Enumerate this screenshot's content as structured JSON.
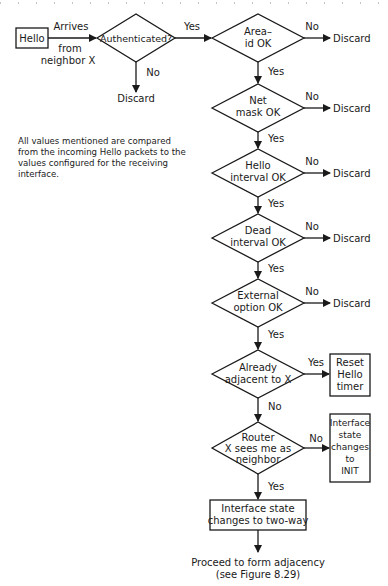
{
  "diagram": {
    "start": {
      "label": "Hello",
      "arrow_top": "Arrives",
      "arrow_bottom_1": "from",
      "arrow_bottom_2": "neighbor X"
    },
    "authenticated": {
      "label": "Authenticated?",
      "yes": "Yes",
      "no": "No",
      "no_target": "Discard"
    },
    "checks": [
      {
        "line1": "Area–",
        "line2": "id OK",
        "no": "No",
        "no_target": "Discard",
        "yes": "Yes"
      },
      {
        "line1": "Net",
        "line2": "mask OK",
        "no": "No",
        "no_target": "Discard",
        "yes": "Yes"
      },
      {
        "line1": "Hello",
        "line2": "interval OK",
        "no": "No",
        "no_target": "Discard",
        "yes": "Yes"
      },
      {
        "line1": "Dead",
        "line2": "interval OK",
        "no": "No",
        "no_target": "Discard",
        "yes": "Yes"
      },
      {
        "line1": "External",
        "line2": "option OK",
        "no": "No",
        "no_target": "Discard",
        "yes": "Yes"
      }
    ],
    "adjacent": {
      "line1": "Already",
      "line2": "adjacent to X",
      "yes": "Yes",
      "no": "No",
      "yes_box": [
        "Reset",
        "Hello",
        "timer"
      ]
    },
    "router": {
      "line1": "Router",
      "line2": "X sees me as",
      "line3": "neighbor",
      "no": "No",
      "yes": "Yes",
      "no_box": [
        "Interface",
        "state",
        "changes",
        "to",
        "INIT"
      ]
    },
    "two_way": {
      "line1": "Interface state",
      "line2": "changes to two-way"
    },
    "end": {
      "line1": "Proceed to form adjacency",
      "line2": "(see Figure 8.29)"
    },
    "note": "All values mentioned are compared from the incoming Hello packets to the values configured for the receiving interface."
  }
}
